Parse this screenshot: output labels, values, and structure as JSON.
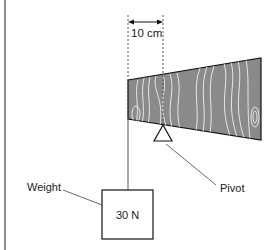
{
  "diagram": {
    "distance_label": "10 cm",
    "weight_label": "Weight",
    "weight_value": "30 N",
    "pivot_label": "Pivot",
    "colors": {
      "plank_fill": "#8a8a8a",
      "grain": "#f2f2f2",
      "line": "#222222"
    }
  }
}
